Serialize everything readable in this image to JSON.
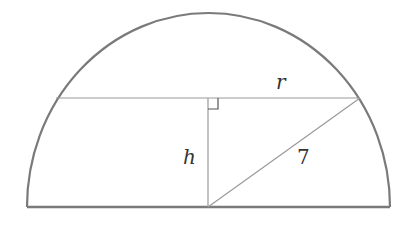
{
  "diagram": {
    "type": "semicircle with inscribed chord",
    "labels": {
      "radius": "r",
      "height": "h",
      "hypotenuse": "7"
    },
    "stroke_color": "#7a7a7a"
  }
}
